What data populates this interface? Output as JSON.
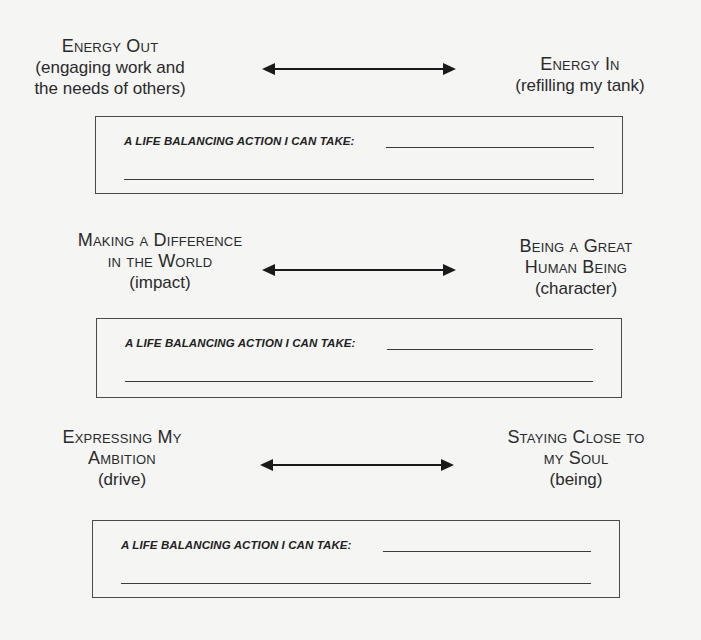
{
  "sections": [
    {
      "left": {
        "title_lines": [
          "Energy Out"
        ],
        "subtitle_lines": [
          "(engaging work and",
          "the needs of others)"
        ]
      },
      "right": {
        "title_lines": [
          "Energy In"
        ],
        "subtitle_lines": [
          "(refilling my tank)"
        ]
      },
      "action_box": {
        "prompt": "A LIFE BALANCING ACTION I CAN TAKE:",
        "line1_value": "",
        "line2_value": ""
      }
    },
    {
      "left": {
        "title_lines": [
          "Making a Difference",
          "in the World"
        ],
        "subtitle_lines": [
          "(impact)"
        ]
      },
      "right": {
        "title_lines": [
          "Being a Great",
          "Human Being"
        ],
        "subtitle_lines": [
          "(character)"
        ]
      },
      "action_box": {
        "prompt": "A LIFE BALANCING ACTION I CAN TAKE:",
        "line1_value": "",
        "line2_value": ""
      }
    },
    {
      "left": {
        "title_lines": [
          "Expressing My",
          "Ambition"
        ],
        "subtitle_lines": [
          "(drive)"
        ]
      },
      "right": {
        "title_lines": [
          "Staying Close to",
          "my Soul"
        ],
        "subtitle_lines": [
          "(being)"
        ]
      },
      "action_box": {
        "prompt": "A LIFE BALANCING ACTION I CAN TAKE:",
        "line1_value": "",
        "line2_value": ""
      }
    }
  ],
  "icons": {
    "arrow": "double-headed-arrow"
  },
  "colors": {
    "background": "#f5f5f4",
    "ink": "#2a2a2a"
  }
}
